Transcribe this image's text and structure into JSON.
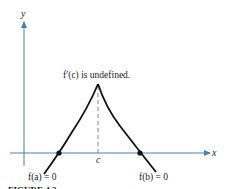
{
  "diagram": {
    "type": "function-graph",
    "axes": {
      "x_label": "x",
      "y_label": "y",
      "axis_color": "#4a7fae"
    },
    "curve_color": "#111111",
    "annotations": {
      "peak": "f′(c) is undefined.",
      "c_tick": "c",
      "root_a": "f(a) = 0",
      "root_b": "f(b) = 0"
    },
    "caption": "FIGURE 4.2"
  }
}
